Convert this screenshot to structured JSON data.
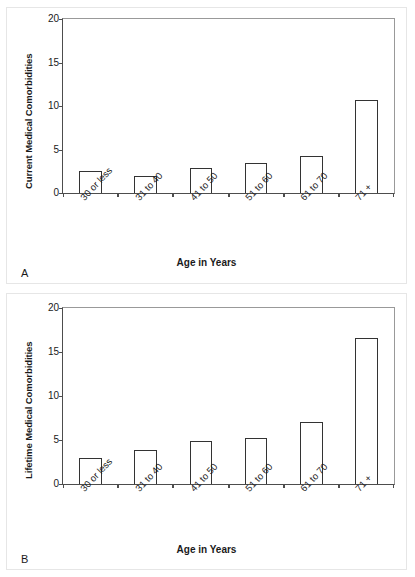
{
  "figure": {
    "background": "#ffffff",
    "bar_outline_color": "#333333",
    "axis_color": "#4d4d4d"
  },
  "panels": [
    {
      "letter": "A",
      "xlabel": "Age in Years",
      "ylabel": "Current Medical Comorbidities"
    },
    {
      "letter": "B",
      "xlabel": "Age in Years",
      "ylabel": "Lifetime Medical Comorbidities"
    }
  ],
  "chart_data": [
    {
      "type": "bar",
      "panel": "A",
      "title": "",
      "xlabel": "Age in Years",
      "ylabel": "Current Medical Comorbidities",
      "categories": [
        "30 or less",
        "31 to 40",
        "41 to 50",
        "51 to 60",
        "61 to 70",
        "71 +"
      ],
      "values": [
        2.5,
        2.0,
        2.9,
        3.4,
        4.3,
        10.7
      ],
      "ylim": [
        0,
        20
      ],
      "yticks": [
        0,
        5,
        10,
        15,
        20
      ],
      "ytick_labels": [
        "0",
        "5",
        "10",
        "15",
        "20"
      ],
      "grid": false,
      "legend": false
    },
    {
      "type": "bar",
      "panel": "B",
      "title": "",
      "xlabel": "Age in Years",
      "ylabel": "Lifetime Medical Comorbidities",
      "categories": [
        "30 or less",
        "31 to 40",
        "41 to 50",
        "51 to 60",
        "61 to 70",
        "71 +"
      ],
      "values": [
        3.0,
        3.9,
        4.9,
        5.2,
        7.1,
        16.6
      ],
      "ylim": [
        0,
        20
      ],
      "yticks": [
        0,
        5,
        10,
        15,
        20
      ],
      "ytick_labels": [
        "0",
        "5",
        "10",
        "15",
        "20"
      ],
      "grid": false,
      "legend": false
    }
  ]
}
